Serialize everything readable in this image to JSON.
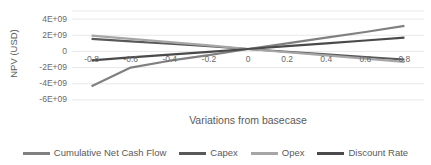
{
  "chart_data": {
    "type": "line",
    "title": "",
    "xlabel": "Variations from basecase",
    "ylabel": "NPV (USD)",
    "xlim": [
      -0.9,
      0.9
    ],
    "ylim": [
      -7000000000,
      5000000000
    ],
    "grid": true,
    "legend_position": "bottom",
    "x": [
      -0.8,
      -0.6,
      -0.4,
      -0.2,
      0,
      0.2,
      0.4,
      0.6,
      0.8
    ],
    "xticks": [
      "-0.8",
      "-0.6",
      "-0.4",
      "-0.2",
      "0",
      "0.2",
      "0.4",
      "0.6",
      "0.8"
    ],
    "yticks": [
      "4E+09",
      "2E+09",
      "0",
      "-2E+09",
      "-4E+09",
      "-6E+09"
    ],
    "ytick_values": [
      4000000000,
      2000000000,
      0,
      -2000000000,
      -4000000000,
      -6000000000
    ],
    "series": [
      {
        "name": "Cumulative Net Cash Flow",
        "color": "#808080",
        "width": 2.2,
        "values": [
          -4300000000,
          -2000000000,
          -1150000000,
          -450000000,
          300000000,
          1000000000,
          1700000000,
          2400000000,
          3150000000
        ]
      },
      {
        "name": "Capex",
        "color": "#595959",
        "width": 2.2,
        "values": [
          1550000000,
          1250000000,
          950000000,
          640000000,
          300000000,
          -40000000,
          -370000000,
          -700000000,
          -1000000000
        ]
      },
      {
        "name": "Opex",
        "color": "#a6a6a6",
        "width": 2.2,
        "values": [
          1950000000,
          1550000000,
          1150000000,
          740000000,
          300000000,
          -100000000,
          -500000000,
          -900000000,
          -1300000000
        ]
      },
      {
        "name": "Discount Rate",
        "color": "#4a4a4a",
        "width": 2.2,
        "values": [
          -1100000000,
          -740000000,
          -400000000,
          -50000000,
          300000000,
          650000000,
          1000000000,
          1350000000,
          1700000000
        ]
      }
    ]
  },
  "axis": {
    "y_title": "NPV (USD)",
    "x_title": "Variations from basecase"
  },
  "legend": {
    "items": [
      {
        "label": "Cumulative Net Cash Flow",
        "color": "#808080"
      },
      {
        "label": "Capex",
        "color": "#595959"
      },
      {
        "label": "Opex",
        "color": "#a6a6a6"
      },
      {
        "label": "Discount Rate",
        "color": "#4a4a4a"
      }
    ]
  },
  "colors": {
    "gridline": "#e8e8e8",
    "text": "#5a5a5a",
    "background": "#ffffff"
  }
}
